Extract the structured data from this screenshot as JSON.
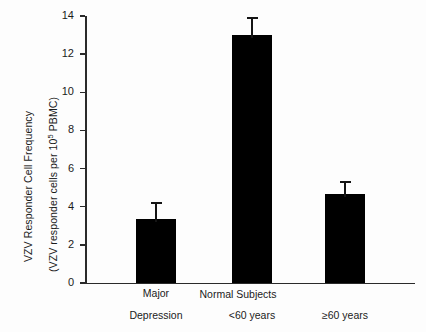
{
  "chart_data": {
    "type": "bar",
    "title": "",
    "xlabel": "",
    "ylabel": "VZV Responder Cell Frequency (VZV responder cells per 10^5 PBMC)",
    "ylabel_line1": "VZV Responder Cell Frequency",
    "ylabel_line2_pre": "(VZV responder cells per 10",
    "ylabel_line2_sup": "5",
    "ylabel_line2_post": " PBMC)",
    "ylim": [
      0,
      14
    ],
    "ytick_step": 2,
    "yticks": [
      "14",
      "12",
      "10",
      "8",
      "6",
      "4",
      "2",
      "0"
    ],
    "ytick_values": [
      14,
      12,
      10,
      8,
      6,
      4,
      2,
      0
    ],
    "grid": false,
    "legend": "none",
    "categories": [
      "Major Depression",
      "<60 years",
      "≥60 years"
    ],
    "values": [
      3.35,
      13.0,
      4.65
    ],
    "errors": [
      0.9,
      0.95,
      0.7
    ],
    "bar_color": "#000000",
    "axis_color": "#2a2a2a",
    "group_label": "Normal Subjects",
    "group_members": [
      "<60 years",
      "≥60 years"
    ]
  },
  "xaxis": {
    "labels": [
      {
        "line1": "Major",
        "line2": "Depression"
      },
      {
        "line1": "",
        "line2": "<60 years"
      },
      {
        "line1": "",
        "line2": "≥60 years"
      }
    ],
    "group_title": "Normal Subjects"
  }
}
